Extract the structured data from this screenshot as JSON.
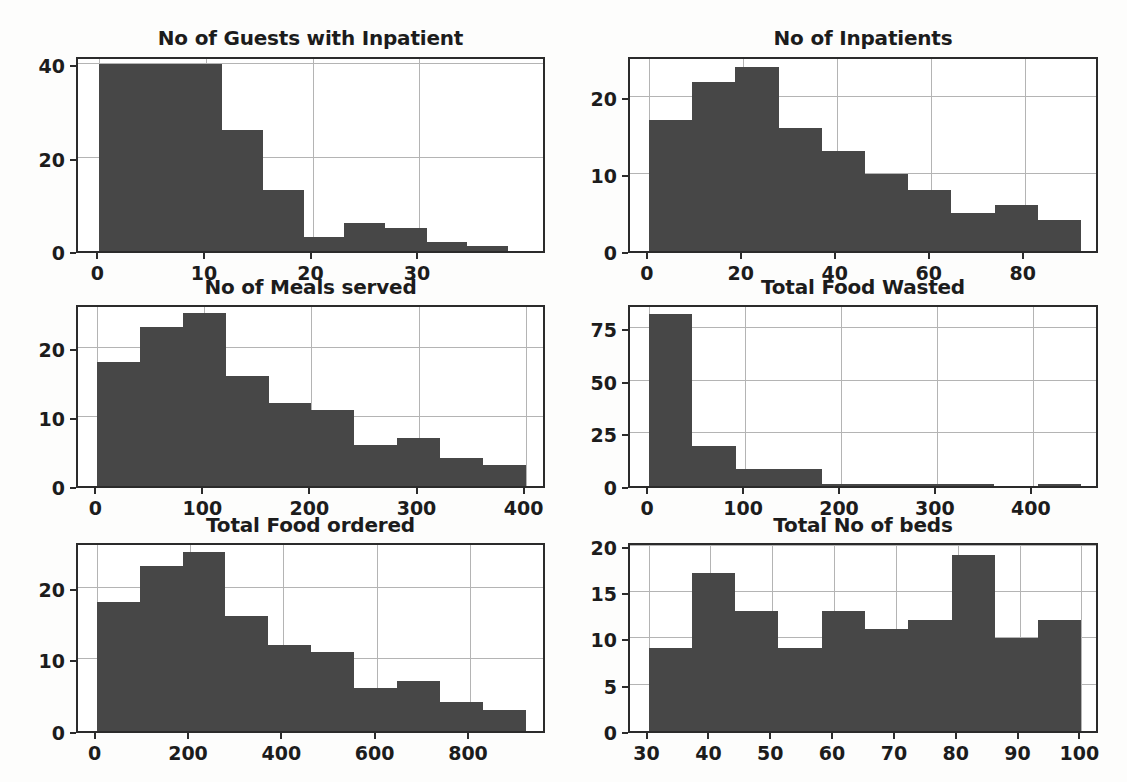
{
  "figure": {
    "background_color": "#fdfdfc",
    "bar_color": "#474747",
    "axis_color": "#2b2b2b",
    "grid_color": "#b4b4b4",
    "rows": 3,
    "cols": 2
  },
  "chart_data": [
    {
      "type": "bar",
      "title": "No of Guests with Inpatient",
      "xlabel": "",
      "ylabel": "",
      "grid": true,
      "legend": "none",
      "bin_edges": [
        0,
        3.8,
        11.5,
        15.4,
        19.2,
        23,
        26.8,
        30.7,
        34.5,
        38.3
      ],
      "categories": [
        "0-3.8",
        "3.8-7.7",
        "7.7-11.5",
        "11.5-15.4",
        "15.4-19.2",
        "19.2-23",
        "23-26.8",
        "26.8-30.7",
        "30.7-34.5",
        "34.5-38.3"
      ],
      "values": [
        40,
        40,
        26,
        13,
        3,
        6,
        5,
        2,
        1,
        3
      ],
      "xticks": [
        0,
        10,
        20,
        30
      ],
      "yticks": [
        0,
        20,
        40
      ],
      "xlim": [
        -2,
        42
      ],
      "ylim": [
        0,
        42
      ]
    },
    {
      "type": "bar",
      "title": "No of Inpatients",
      "xlabel": "",
      "ylabel": "",
      "grid": true,
      "legend": "none",
      "bin_edges": [
        0,
        9.2,
        18.4,
        27.6,
        36.8,
        46,
        55.2,
        64.4,
        73.6,
        82.8,
        92
      ],
      "categories": [
        "0-9.2",
        "9.2-18.4",
        "18.4-27.6",
        "27.6-36.8",
        "36.8-46",
        "46-55.2",
        "55.2-64.4",
        "64.4-73.6",
        "73.6-82.8",
        "82.8-92"
      ],
      "values": [
        17,
        22,
        24,
        16,
        13,
        10,
        8,
        5,
        6,
        4
      ],
      "xticks": [
        0,
        20,
        40,
        60,
        80
      ],
      "yticks": [
        0,
        10,
        20
      ],
      "xlim": [
        -4,
        96
      ],
      "ylim": [
        0,
        25.5
      ]
    },
    {
      "type": "bar",
      "title": "No of Meals served",
      "xlabel": "",
      "ylabel": "",
      "grid": true,
      "legend": "none",
      "bin_edges": [
        0,
        40,
        80,
        120,
        160,
        200,
        240,
        280,
        320,
        360,
        400
      ],
      "categories": [
        "0-40",
        "40-80",
        "80-120",
        "120-160",
        "160-200",
        "200-240",
        "240-280",
        "280-320",
        "320-360",
        "360-400"
      ],
      "values": [
        18,
        23,
        25,
        16,
        12,
        11,
        6,
        7,
        4,
        3
      ],
      "xticks": [
        0,
        100,
        200,
        300,
        400
      ],
      "yticks": [
        0,
        10,
        20
      ],
      "xlim": [
        -18,
        420
      ],
      "ylim": [
        0,
        26.5
      ]
    },
    {
      "type": "bar",
      "title": "Total Food Wasted",
      "xlabel": "",
      "ylabel": "",
      "grid": true,
      "legend": "none",
      "bin_edges": [
        0,
        45,
        90,
        135,
        180,
        225,
        270,
        315,
        360,
        405,
        450
      ],
      "categories": [
        "0-45",
        "45-90",
        "90-135",
        "135-180",
        "180-225",
        "225-270",
        "270-315",
        "315-360",
        "360-405",
        "405-450"
      ],
      "values": [
        82,
        19,
        8,
        8,
        1,
        1,
        1,
        1,
        0,
        1
      ],
      "xticks": [
        0,
        100,
        200,
        300,
        400
      ],
      "yticks": [
        0,
        25,
        50,
        75
      ],
      "xlim": [
        -20,
        470
      ],
      "ylim": [
        0,
        87
      ]
    },
    {
      "type": "bar",
      "title": "Total Food ordered",
      "xlabel": "",
      "ylabel": "",
      "grid": true,
      "legend": "none",
      "bin_edges": [
        0,
        92,
        184,
        276,
        368,
        460,
        552,
        644,
        736,
        828,
        920
      ],
      "categories": [
        "0-92",
        "92-184",
        "184-276",
        "276-368",
        "368-460",
        "460-552",
        "552-644",
        "644-736",
        "736-828",
        "828-920"
      ],
      "values": [
        18,
        23,
        25,
        16,
        12,
        11,
        6,
        7,
        4,
        3
      ],
      "xticks": [
        0,
        200,
        400,
        600,
        800
      ],
      "yticks": [
        0,
        10,
        20
      ],
      "xlim": [
        -40,
        965
      ],
      "ylim": [
        0,
        26.5
      ]
    },
    {
      "type": "bar",
      "title": "Total No of beds",
      "xlabel": "",
      "ylabel": "",
      "grid": true,
      "legend": "none",
      "bin_edges": [
        30,
        37,
        44,
        51,
        58,
        65,
        72,
        79,
        86,
        93,
        100
      ],
      "categories": [
        "30-37",
        "37-44",
        "44-51",
        "51-58",
        "58-65",
        "65-72",
        "72-79",
        "79-86",
        "86-93",
        "93-100"
      ],
      "values": [
        9,
        17,
        13,
        9,
        13,
        11,
        12,
        19,
        10,
        12
      ],
      "xticks": [
        30,
        40,
        50,
        60,
        70,
        80,
        90,
        100
      ],
      "yticks": [
        0,
        5,
        10,
        15,
        20
      ],
      "xlim": [
        27,
        103
      ],
      "ylim": [
        0,
        20.5
      ]
    }
  ]
}
